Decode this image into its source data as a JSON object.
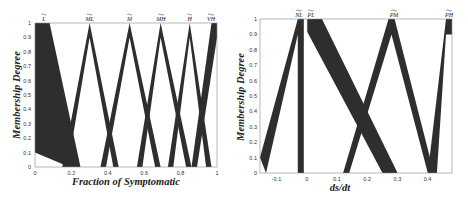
{
  "chart_data": [
    {
      "type": "area",
      "title": "",
      "xlabel": "Fraction of Symptomatic",
      "ylabel": "Membership Degree",
      "xlim": [
        0,
        1
      ],
      "ylim": [
        0,
        1
      ],
      "x_ticks": [
        "0",
        "0.2",
        "0.4",
        "0.6",
        "0.8",
        "1"
      ],
      "y_ticks": [
        "0",
        "0.1",
        "0.2",
        "0.3",
        "0.4",
        "0.5",
        "0.6",
        "0.7",
        "0.8",
        "0.9",
        "1"
      ],
      "grid": false,
      "description": "Interval type-2 fuzzy membership functions (footprints of uncertainty drawn as dark bands)",
      "series": [
        {
          "name": "L~",
          "label": "L",
          "upper": [
            [
              0,
              1
            ],
            [
              0.08,
              1
            ],
            [
              0.25,
              0
            ]
          ],
          "lower": [
            [
              0,
              0.1
            ],
            [
              0.15,
              0.02
            ],
            [
              0.17,
              0
            ]
          ]
        },
        {
          "name": "ML~",
          "label": "ML",
          "upper": [
            [
              0.15,
              0
            ],
            [
              0.3,
              1
            ],
            [
              0.46,
              0
            ]
          ],
          "lower": [
            [
              0.18,
              0
            ],
            [
              0.3,
              0.9
            ],
            [
              0.43,
              0
            ]
          ]
        },
        {
          "name": "M~",
          "label": "M",
          "upper": [
            [
              0.36,
              0
            ],
            [
              0.52,
              1
            ],
            [
              0.69,
              0
            ]
          ],
          "lower": [
            [
              0.39,
              0
            ],
            [
              0.52,
              0.9
            ],
            [
              0.66,
              0
            ]
          ]
        },
        {
          "name": "MH~",
          "label": "MH",
          "upper": [
            [
              0.56,
              0
            ],
            [
              0.69,
              1
            ],
            [
              0.86,
              0
            ]
          ],
          "lower": [
            [
              0.59,
              0
            ],
            [
              0.69,
              0.9
            ],
            [
              0.83,
              0
            ]
          ]
        },
        {
          "name": "H~",
          "label": "H",
          "upper": [
            [
              0.73,
              0
            ],
            [
              0.85,
              1
            ],
            [
              0.97,
              0
            ]
          ],
          "lower": [
            [
              0.76,
              0
            ],
            [
              0.85,
              0.9
            ],
            [
              0.94,
              0
            ]
          ]
        },
        {
          "name": "VH~",
          "label": "VH",
          "upper": [
            [
              0.86,
              0
            ],
            [
              0.97,
              1
            ],
            [
              1,
              1
            ]
          ],
          "lower": [
            [
              0.89,
              0
            ],
            [
              1,
              0.9
            ]
          ]
        }
      ]
    },
    {
      "type": "area",
      "title": "",
      "xlabel": "ds/dt",
      "ylabel": "Membership Degree",
      "xlim": [
        -0.155,
        0.48
      ],
      "ylim": [
        0,
        1
      ],
      "x_ticks": [
        "-0.1",
        "0",
        "0.1",
        "0.2",
        "0.3",
        "0.4"
      ],
      "y_ticks": [
        "0",
        "0.1",
        "0.2",
        "0.3",
        "0.4",
        "0.5",
        "0.6",
        "0.7",
        "0.8",
        "0.9",
        "1"
      ],
      "grid": false,
      "description": "Interval type-2 fuzzy membership functions for rate of change ds/dt",
      "series": [
        {
          "name": "NL~",
          "label": "NL",
          "upper": [
            [
              -0.155,
              0.1
            ],
            [
              -0.03,
              1
            ],
            [
              -0.01,
              1
            ],
            [
              -0.01,
              0
            ]
          ],
          "lower": [
            [
              -0.135,
              0
            ],
            [
              -0.03,
              0.9
            ],
            [
              -0.03,
              0
            ]
          ]
        },
        {
          "name": "PL~",
          "label": "PL",
          "upper": [
            [
              0,
              1
            ],
            [
              0.05,
              1
            ],
            [
              0.3,
              0
            ]
          ],
          "lower": [
            [
              0,
              0.92
            ],
            [
              0.25,
              0
            ]
          ]
        },
        {
          "name": "PM~",
          "label": "PM",
          "upper": [
            [
              0.12,
              0
            ],
            [
              0.27,
              1
            ],
            [
              0.29,
              1
            ],
            [
              0.42,
              0
            ]
          ],
          "lower": [
            [
              0.14,
              0
            ],
            [
              0.28,
              0.9
            ],
            [
              0.4,
              0
            ]
          ]
        },
        {
          "name": "PH~",
          "label": "PH",
          "upper": [
            [
              0.4,
              0
            ],
            [
              0.46,
              1
            ],
            [
              0.48,
              1
            ]
          ],
          "lower": [
            [
              0.43,
              0
            ],
            [
              0.46,
              0.9
            ],
            [
              0.48,
              0.9
            ]
          ]
        }
      ]
    }
  ],
  "plots": [
    {
      "xlabel": "Fraction of Symptomatic",
      "ylabel": "Membership Degree",
      "set_labels": [
        "L",
        "ML",
        "M",
        "MH",
        "H",
        "VH"
      ],
      "x_ticks": [
        "0",
        "0.2",
        "0.4",
        "0.6",
        "0.8",
        "1"
      ],
      "y_ticks": [
        "0",
        "0.1",
        "0.2",
        "0.3",
        "0.4",
        "0.5",
        "0.6",
        "0.7",
        "0.8",
        "0.9",
        "1"
      ]
    },
    {
      "xlabel": "ds/dt",
      "ylabel": "Membership Degree",
      "set_labels": [
        "NL",
        "PL",
        "PM",
        "PH"
      ],
      "x_ticks": [
        "-0.1",
        "0",
        "0.1",
        "0.2",
        "0.3",
        "0.4"
      ],
      "y_ticks": [
        "0",
        "0.1",
        "0.2",
        "0.3",
        "0.4",
        "0.5",
        "0.6",
        "0.7",
        "0.8",
        "0.9",
        "1"
      ]
    }
  ],
  "colors": {
    "band": "#2e2e2e",
    "frame": "#888888",
    "background": "#ffffff"
  }
}
